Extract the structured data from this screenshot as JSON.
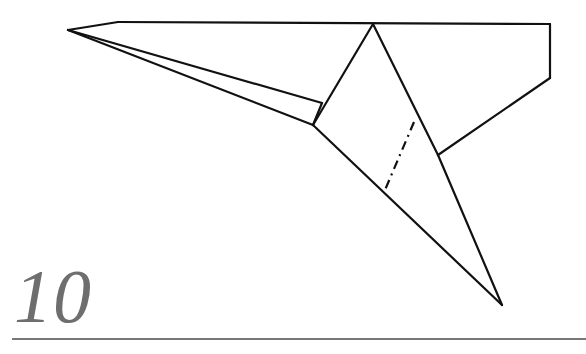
{
  "page": {
    "background_color": "#ffffff",
    "width": 586,
    "height": 354
  },
  "step": {
    "number": "10",
    "color": "#6e6e6e",
    "style": "italic-serif"
  },
  "rule": {
    "color": "#787878",
    "thickness": 2
  },
  "figure": {
    "name": "origami-folding-diagram",
    "stroke_color": "#111111",
    "stroke_width": 2.2,
    "points": {
      "left_tip": [
        68,
        30
      ],
      "top_left_corner": [
        118,
        22
      ],
      "top_apex": [
        373,
        24
      ],
      "top_right_corner": [
        550,
        24
      ],
      "right_lower_corner": [
        550,
        78
      ],
      "notch": [
        438,
        155
      ],
      "mid_junction_upper": [
        322,
        103
      ],
      "mid_junction_lower": [
        313,
        125
      ],
      "bottom_tip": [
        502,
        305
      ],
      "dashdot_top": [
        414,
        122
      ],
      "dashdot_bottom": [
        385,
        190
      ]
    },
    "solid_edges": [
      {
        "name": "top-horizontal-edge",
        "from": [
          118,
          22
        ],
        "to": [
          550,
          24
        ]
      },
      {
        "name": "left-tip-upper-edge",
        "from": [
          68,
          30
        ],
        "to": [
          118,
          22
        ]
      },
      {
        "name": "left-tip-to-upper-junction",
        "from": [
          68,
          30
        ],
        "to": [
          322,
          103
        ]
      },
      {
        "name": "left-tip-to-lower-junction",
        "from": [
          68,
          30
        ],
        "to": [
          313,
          125
        ]
      },
      {
        "name": "upper-to-lower-junction",
        "from": [
          322,
          103
        ],
        "to": [
          313,
          125
        ]
      },
      {
        "name": "apex-to-lower-junction",
        "from": [
          373,
          24
        ],
        "to": [
          313,
          125
        ]
      },
      {
        "name": "apex-to-notch",
        "from": [
          373,
          24
        ],
        "to": [
          438,
          155
        ]
      },
      {
        "name": "notch-to-bottom-tip",
        "from": [
          438,
          155
        ],
        "to": [
          502,
          305
        ]
      },
      {
        "name": "lower-junction-to-bottom-tip",
        "from": [
          313,
          125
        ],
        "to": [
          502,
          305
        ]
      },
      {
        "name": "right-vertical-edge",
        "from": [
          550,
          24
        ],
        "to": [
          550,
          78
        ]
      },
      {
        "name": "right-slant-to-notch",
        "from": [
          550,
          78
        ],
        "to": [
          438,
          155
        ]
      }
    ],
    "dash_dot_edges": [
      {
        "name": "fold-line-dash-dot",
        "from": [
          414,
          122
        ],
        "to": [
          385,
          190
        ],
        "pattern": "9 5 2 5"
      }
    ]
  }
}
